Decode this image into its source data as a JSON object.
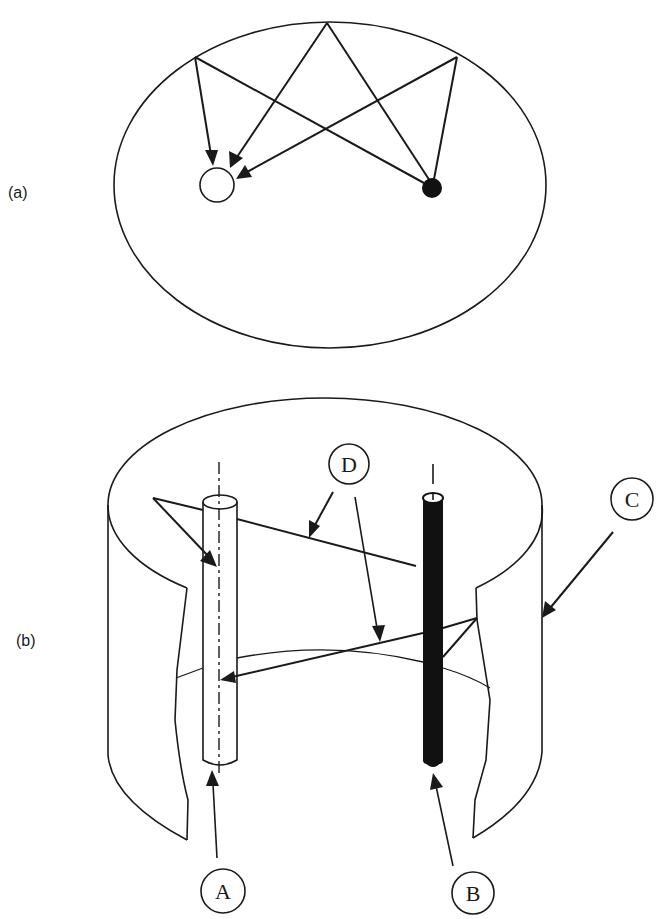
{
  "figure": {
    "panel_a": {
      "label": "(a)",
      "description": "Top view: room ellipse with three ceiling reflection points; rays from black source to white receiver",
      "source_color": "#111111",
      "receiver_color": "#ffffff"
    },
    "panel_b": {
      "label": "(b)",
      "description": "Cutaway cylindrical room with two vertical rods and reflected rays",
      "callouts": {
        "A": "A",
        "B": "B",
        "C": "C",
        "D": "D"
      }
    }
  },
  "colors": {
    "ink": "#1a1a1a",
    "background": "#ffffff"
  }
}
